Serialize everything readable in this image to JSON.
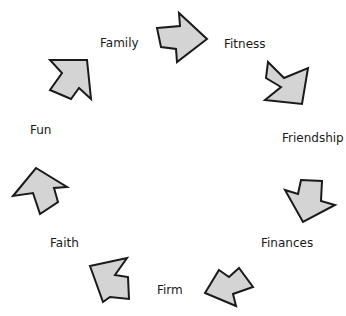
{
  "diagram": {
    "type": "cycle",
    "arrow_fill": "#d4d4d4",
    "arrow_stroke": "#1a1a1a",
    "labels": [
      "Family",
      "Fitness",
      "Friendship",
      "Finances",
      "Firm",
      "Faith",
      "Fun"
    ],
    "arrows": [
      {
        "from": "Family",
        "to": "Fitness",
        "direction": "right"
      },
      {
        "from": "Fitness",
        "to": "Friendship",
        "direction": "down-right"
      },
      {
        "from": "Friendship",
        "to": "Finances",
        "direction": "down-right"
      },
      {
        "from": "Finances",
        "to": "Firm",
        "direction": "down-left"
      },
      {
        "from": "Firm",
        "to": "Faith",
        "direction": "up-left"
      },
      {
        "from": "Faith",
        "to": "Fun",
        "direction": "up-left"
      },
      {
        "from": "Fun",
        "to": "Family",
        "direction": "up-left"
      }
    ]
  }
}
